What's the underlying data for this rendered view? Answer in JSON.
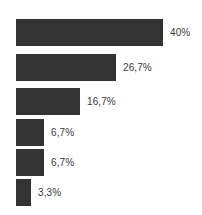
{
  "chart_data": {
    "type": "bar",
    "orientation": "horizontal",
    "title": "",
    "subtitle": "",
    "xlabel": "",
    "ylabel": "",
    "grid": false,
    "legend": null,
    "axis_visible": false,
    "bar_color": "#333333",
    "label_color": "#3a3a3a",
    "background_color": "#ffffff",
    "xlim": [
      0,
      40
    ],
    "categories": [
      "",
      "",
      "",
      "",
      "",
      ""
    ],
    "values": [
      40,
      26.7,
      16.7,
      6.7,
      6.7,
      3.3
    ],
    "data_labels": [
      "40%",
      "26,7%",
      "16,7%",
      "6,7%",
      "6,7%",
      "3,3%"
    ],
    "bars": [
      {
        "value": 40,
        "label": "40%",
        "bar_px": 147
      },
      {
        "value": 26.7,
        "label": "26,7%",
        "bar_px": 100
      },
      {
        "value": 16.7,
        "label": "16,7%",
        "bar_px": 64
      },
      {
        "value": 6.7,
        "label": "6,7%",
        "bar_px": 28
      },
      {
        "value": 6.7,
        "label": "6,7%",
        "bar_px": 28
      },
      {
        "value": 3.3,
        "label": "3,3%",
        "bar_px": 15
      }
    ],
    "plot_left_px": 16
  }
}
